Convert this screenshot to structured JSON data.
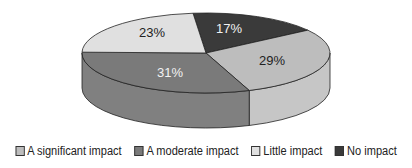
{
  "chart_data": {
    "type": "pie",
    "style": "3d",
    "title": "",
    "categories": [
      "A significant impact",
      "A moderate impact",
      "Little impact",
      "No impact"
    ],
    "values": [
      29,
      31,
      23,
      17
    ],
    "labels": [
      "29%",
      "31%",
      "23%",
      "17%"
    ],
    "colors": [
      "#bdbdbd",
      "#7a7a7a",
      "#e0e0e0",
      "#3a3a3a"
    ],
    "side_colors": [
      "#c6c6c6",
      "#808080",
      "#d8d8d8",
      "#333333"
    ],
    "label_colors": [
      "#222222",
      "#f2f2f2",
      "#222222",
      "#f2f2f2"
    ],
    "legend_position": "bottom"
  },
  "legend": {
    "items": [
      {
        "label": "A significant impact",
        "color": "#bdbdbd"
      },
      {
        "label": "A moderate impact",
        "color": "#7a7a7a"
      },
      {
        "label": "Little impact",
        "color": "#e0e0e0"
      },
      {
        "label": "No impact",
        "color": "#3a3a3a"
      }
    ]
  }
}
